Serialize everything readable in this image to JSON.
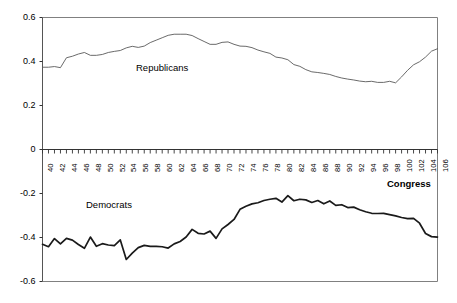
{
  "chart_data": {
    "type": "line",
    "title": "",
    "xlabel": "Congress",
    "ylabel": "Mean DW-Nominate Score",
    "ylim": [
      -0.6,
      0.6
    ],
    "xlim": [
      40,
      106
    ],
    "yticks": [
      "0.6",
      "0.4",
      "0.2",
      "0",
      "-0.2",
      "-0.4",
      "-0.6"
    ],
    "ytick_values": [
      0.6,
      0.4,
      0.2,
      0,
      -0.2,
      -0.4,
      -0.6
    ],
    "grid": false,
    "legend_position": "inline-annotations",
    "x": [
      40,
      41,
      42,
      43,
      44,
      45,
      46,
      47,
      48,
      49,
      50,
      51,
      52,
      53,
      54,
      55,
      56,
      57,
      58,
      59,
      60,
      61,
      62,
      63,
      64,
      65,
      66,
      67,
      68,
      69,
      70,
      71,
      72,
      73,
      74,
      75,
      76,
      77,
      78,
      79,
      80,
      81,
      82,
      83,
      84,
      85,
      86,
      87,
      88,
      89,
      90,
      91,
      92,
      93,
      94,
      95,
      96,
      97,
      98,
      99,
      100,
      101,
      102,
      103,
      104,
      105,
      106
    ],
    "xtick_labels": [
      "40",
      "",
      "42",
      "",
      "44",
      "",
      "46",
      "",
      "48",
      "",
      "50",
      "",
      "52",
      "",
      "54",
      "",
      "56",
      "",
      "58",
      "",
      "60",
      "",
      "62",
      "",
      "64",
      "",
      "66",
      "",
      "68",
      "",
      "70",
      "",
      "72",
      "",
      "74",
      "",
      "76",
      "",
      "78",
      "",
      "80",
      "",
      "82",
      "",
      "84",
      "",
      "86",
      "",
      "88",
      "",
      "90",
      "",
      "92",
      "",
      "94",
      "",
      "96",
      "",
      "98",
      "",
      "100",
      "",
      "102",
      "",
      "104",
      "",
      "106"
    ],
    "series": [
      {
        "name": "Republicans",
        "color": "#595959",
        "width": 0.9,
        "label_x": 106,
        "values": [
          0.374,
          0.374,
          0.377,
          0.372,
          0.417,
          0.424,
          0.434,
          0.441,
          0.428,
          0.428,
          0.432,
          0.441,
          0.446,
          0.45,
          0.462,
          0.469,
          0.464,
          0.47,
          0.486,
          0.497,
          0.508,
          0.519,
          0.524,
          0.524,
          0.524,
          0.518,
          0.504,
          0.491,
          0.478,
          0.478,
          0.487,
          0.489,
          0.478,
          0.47,
          0.469,
          0.463,
          0.452,
          0.444,
          0.437,
          0.42,
          0.416,
          0.408,
          0.386,
          0.378,
          0.363,
          0.353,
          0.35,
          0.346,
          0.341,
          0.332,
          0.325,
          0.32,
          0.316,
          0.311,
          0.308,
          0.31,
          0.305,
          0.305,
          0.31,
          0.303,
          0.33,
          0.36,
          0.385,
          0.399,
          0.42,
          0.447,
          0.458
        ]
      },
      {
        "name": "Democrats",
        "color": "#1a1a1a",
        "width": 1.7,
        "label_x": 46,
        "values": [
          -0.431,
          -0.442,
          -0.405,
          -0.429,
          -0.404,
          -0.412,
          -0.432,
          -0.449,
          -0.398,
          -0.44,
          -0.428,
          -0.434,
          -0.437,
          -0.411,
          -0.5,
          -0.471,
          -0.446,
          -0.436,
          -0.44,
          -0.44,
          -0.442,
          -0.448,
          -0.429,
          -0.418,
          -0.398,
          -0.363,
          -0.381,
          -0.384,
          -0.371,
          -0.404,
          -0.361,
          -0.341,
          -0.318,
          -0.272,
          -0.258,
          -0.247,
          -0.242,
          -0.232,
          -0.226,
          -0.222,
          -0.239,
          -0.21,
          -0.233,
          -0.226,
          -0.229,
          -0.241,
          -0.232,
          -0.247,
          -0.234,
          -0.254,
          -0.251,
          -0.264,
          -0.262,
          -0.274,
          -0.283,
          -0.29,
          -0.291,
          -0.29,
          -0.296,
          -0.302,
          -0.309,
          -0.314,
          -0.313,
          -0.335,
          -0.382,
          -0.396,
          -0.398
        ]
      }
    ]
  },
  "axes": {
    "congress_label": "Congress",
    "y_axis_title": "Mean DW-Nominate Score"
  }
}
